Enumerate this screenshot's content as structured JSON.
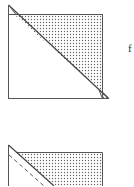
{
  "figures": [
    {
      "id": "top-figure",
      "description": "Square folded along diagonal; upper-right triangle shaded with dot pattern",
      "label": "f"
    },
    {
      "id": "bottom-figure",
      "description": "Partial square with diagonal fold and dashed fold line; upper-right region shaded with dot pattern",
      "label": ""
    }
  ],
  "colors": {
    "line": "#555555",
    "dots": "#666666",
    "background": "#ffffff"
  }
}
